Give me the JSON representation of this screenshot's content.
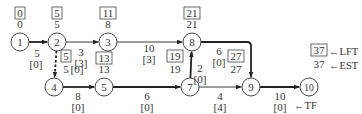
{
  "diagram": {
    "nodes": [
      {
        "id": "1",
        "x": 20,
        "y": 42,
        "lft": "0",
        "est": "0",
        "label_side": "top"
      },
      {
        "id": "2",
        "x": 57,
        "y": 42,
        "lft": "5",
        "est": "5",
        "label_side": "top"
      },
      {
        "id": "3",
        "x": 108,
        "y": 42,
        "lft": "11",
        "est": "8",
        "label_side": "top"
      },
      {
        "id": "4",
        "x": 54,
        "y": 87,
        "lft": "5",
        "est": "5",
        "label_side": "none"
      },
      {
        "id": "5",
        "x": 104,
        "y": 87,
        "lft": "13",
        "est": "13",
        "label_side": "top"
      },
      {
        "id": "7",
        "x": 190,
        "y": 87,
        "lft": "19",
        "est": "19",
        "label_side": "left"
      },
      {
        "id": "8",
        "x": 192,
        "y": 42,
        "lft": "21",
        "est": "21",
        "label_side": "top"
      },
      {
        "id": "9",
        "x": 251,
        "y": 87,
        "lft": "27",
        "est": "27",
        "label_side": "left"
      },
      {
        "id": "10",
        "x": 309,
        "y": 87,
        "lft": "37",
        "est": "37",
        "label_side": "legend"
      }
    ],
    "edges": [
      {
        "from": "1",
        "to": "2",
        "duration": "5",
        "tf": "[0]",
        "critical": true,
        "dummy": false
      },
      {
        "from": "2",
        "to": "3",
        "duration": "3",
        "tf": "[3]",
        "critical": false,
        "dummy": false
      },
      {
        "from": "2",
        "to": "4",
        "duration": "5",
        "tf": "[0]",
        "critical": true,
        "dummy": true
      },
      {
        "from": "3",
        "to": "8",
        "duration": "10",
        "tf": "[3]",
        "critical": false,
        "dummy": false
      },
      {
        "from": "4",
        "to": "5",
        "duration": "8",
        "tf": "[0]",
        "critical": true,
        "dummy": false
      },
      {
        "from": "5",
        "to": "7",
        "duration": "6",
        "tf": "[0]",
        "critical": true,
        "dummy": false
      },
      {
        "from": "7",
        "to": "8",
        "duration": "2",
        "tf": "[0]",
        "critical": true,
        "dummy": false
      },
      {
        "from": "7",
        "to": "9",
        "duration": "4",
        "tf": "[4]",
        "critical": false,
        "dummy": false
      },
      {
        "from": "8",
        "to": "9",
        "duration": "6",
        "tf": "[0]",
        "critical": true,
        "dummy": false
      },
      {
        "from": "9",
        "to": "10",
        "duration": "10",
        "tf": "[0]",
        "critical": true,
        "dummy": false
      }
    ],
    "legend": {
      "lft_label": "←LFT",
      "est_label": "←EST",
      "tf_label": "←TF"
    }
  }
}
